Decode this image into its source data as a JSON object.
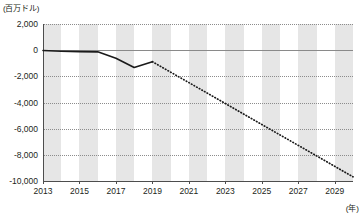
{
  "chart_data": {
    "type": "line",
    "title": "",
    "ylabel": "(百万ドル)",
    "xlabel": "(年)",
    "ylim": [
      -10000,
      2000
    ],
    "xlim": [
      2013,
      2030
    ],
    "grid": true,
    "legend": "none",
    "ytick_labels": [
      "2,000",
      "0",
      "-2,000",
      "-4,000",
      "-6,000",
      "-8,000",
      "-10,000"
    ],
    "ytick_values": [
      2000,
      0,
      -2000,
      -4000,
      -6000,
      -8000,
      -10000
    ],
    "xtick_labels": [
      "2013",
      "2015",
      "2017",
      "2019",
      "2021",
      "2023",
      "2025",
      "2027",
      "2029"
    ],
    "xtick_values": [
      2013,
      2015,
      2017,
      2019,
      2021,
      2023,
      2025,
      2027,
      2029
    ],
    "x": [
      2013,
      2014,
      2015,
      2016,
      2017,
      2018,
      2019,
      2020,
      2021,
      2022,
      2023,
      2024,
      2025,
      2026,
      2027,
      2028,
      2029,
      2030
    ],
    "series": [
      {
        "name": "実績",
        "style": "solid",
        "x": [
          2013,
          2014,
          2015,
          2016,
          2017,
          2018,
          2019
        ],
        "values": [
          -30,
          -80,
          -110,
          -130,
          -620,
          -1330,
          -880
        ]
      },
      {
        "name": "予測",
        "style": "dotted",
        "x": [
          2019,
          2020,
          2021,
          2022,
          2023,
          2024,
          2025,
          2026,
          2027,
          2028,
          2029,
          2030
        ],
        "values": [
          -880,
          -1680,
          -2480,
          -3280,
          -4080,
          -4880,
          -5680,
          -6480,
          -7280,
          -8080,
          -8880,
          -9680
        ]
      }
    ]
  },
  "axes": {
    "unit_label": "(百万ドル)",
    "x_unit_label": "(年)"
  },
  "colors": {
    "line": "#1a1a1a",
    "band": "#e6e6e6",
    "grid": "#8c8c8c",
    "axis": "#4d4d4d",
    "text": "#231f20"
  }
}
